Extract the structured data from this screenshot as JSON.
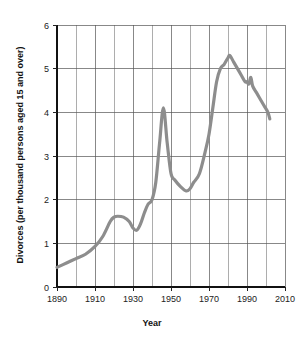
{
  "chart_data": {
    "type": "line",
    "title": "",
    "xlabel": "Year",
    "ylabel": "Divorces (per thousand persons aged 15 and over)",
    "xlim": [
      1890,
      2010
    ],
    "ylim": [
      0,
      6
    ],
    "xticks": [
      1890,
      1910,
      1930,
      1950,
      1970,
      1990,
      2010
    ],
    "xticklabels": [
      "1890",
      "1910",
      "1930",
      "1950",
      "1970",
      "1990",
      "2010"
    ],
    "xminorticks": [
      1900,
      1920,
      1940,
      1960,
      1980,
      2000
    ],
    "yticks": [
      0,
      1,
      2,
      3,
      4,
      5,
      6
    ],
    "yticklabels": [
      "0",
      "1",
      "2",
      "3",
      "4",
      "5",
      "6"
    ],
    "grid": true,
    "legend": false,
    "line_color": "#8d8d8d",
    "series": [
      {
        "name": "Divorce rate",
        "x": [
          1890,
          1895,
          1900,
          1905,
          1910,
          1914,
          1918,
          1920,
          1922,
          1925,
          1928,
          1930,
          1932,
          1934,
          1936,
          1938,
          1940,
          1942,
          1944,
          1946,
          1948,
          1950,
          1952,
          1955,
          1958,
          1960,
          1962,
          1965,
          1968,
          1970,
          1972,
          1974,
          1976,
          1978,
          1980,
          1981,
          1983,
          1985,
          1987,
          1989,
          1990,
          1991,
          1992,
          1993,
          1995,
          1997,
          1999,
          2001,
          2002
        ],
        "y": [
          0.45,
          0.55,
          0.65,
          0.75,
          0.93,
          1.15,
          1.5,
          1.6,
          1.62,
          1.6,
          1.5,
          1.35,
          1.3,
          1.45,
          1.7,
          1.9,
          2.0,
          2.4,
          3.3,
          4.1,
          3.3,
          2.6,
          2.45,
          2.3,
          2.2,
          2.25,
          2.4,
          2.6,
          3.1,
          3.5,
          4.1,
          4.7,
          5.0,
          5.1,
          5.25,
          5.3,
          5.15,
          5.0,
          4.85,
          4.7,
          4.7,
          4.65,
          4.8,
          4.6,
          4.45,
          4.3,
          4.15,
          4.0,
          3.85
        ]
      }
    ]
  },
  "figure": {
    "x_axis_title": "Year",
    "y_axis_title": "Divorces (per thousand persons aged 15 and over)"
  }
}
